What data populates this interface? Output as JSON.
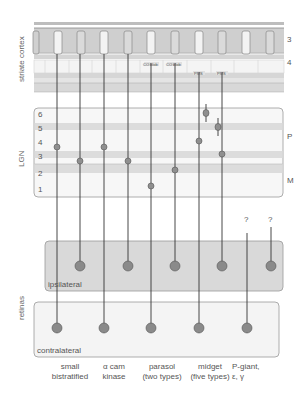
{
  "regions": {
    "cortex": "striate cortex",
    "lgn": "LGN",
    "retinas": "retinas"
  },
  "cortex_layers": [
    "3",
    "4"
  ],
  "cortex_tags": [
    "CO blob",
    "CO blob",
    "PMS",
    "PMS"
  ],
  "lgn_layers": [
    "6",
    "5",
    "4",
    "3",
    "2",
    "1"
  ],
  "lgn_divisions": {
    "P": "P",
    "M": "M"
  },
  "retina_boxes": {
    "ipsilateral": "ipsilateral",
    "contralateral": "contralateral"
  },
  "unknown_marks": [
    "?",
    "?"
  ],
  "cell_types": [
    {
      "line1": "small",
      "line2": "bistratified"
    },
    {
      "line1": "α cam",
      "line2": "kinase"
    },
    {
      "line1": "parasol",
      "line2": "(two types)"
    },
    {
      "line1": "midget",
      "line2": "(five types)"
    },
    {
      "line1": "P-giant,",
      "line2": "ε, γ"
    }
  ],
  "colors": {
    "band_dark": "#c8c8c8",
    "band_light": "#e6e6e6",
    "box_fill": "#d9d9d9",
    "box_light": "#f2f2f2",
    "node": "#8a8a8a",
    "line": "#333333"
  }
}
